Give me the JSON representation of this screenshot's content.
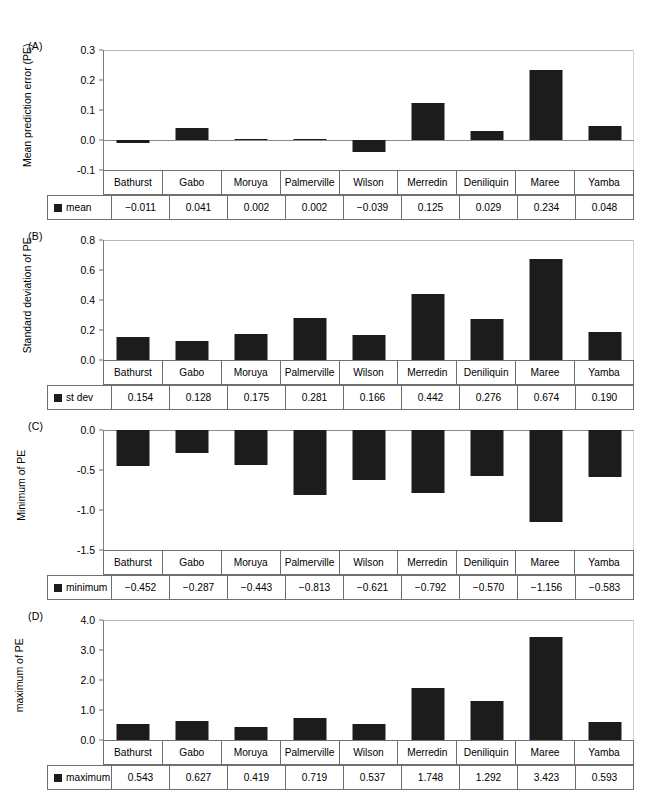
{
  "categories": [
    "Bathurst",
    "Gabo",
    "Moruya",
    "Palmerville",
    "Wilson",
    "Merredin",
    "Deniliquin",
    "Maree",
    "Yamba"
  ],
  "colors": {
    "bar": "#1c1c1c",
    "axis": "#7c7c7c",
    "grid": "#b6b6b6",
    "table_border": "#6f6f6f"
  },
  "panels": [
    {
      "key": "A",
      "letter": "(A)",
      "axis_title": "Mean prediction error (PE)",
      "legend_label": "mean",
      "ticks": [
        "0.3",
        "0.2",
        "0.1",
        "0.0",
        "-0.1"
      ],
      "values_text": [
        "−0.011",
        "0.041",
        "0.002",
        "0.002",
        "−0.039",
        "0.125",
        "0.029",
        "0.234",
        "0.048"
      ]
    },
    {
      "key": "B",
      "letter": "(B)",
      "axis_title": "Standard deviation of PE",
      "legend_label": "st dev",
      "ticks": [
        "0.8",
        "0.6",
        "0.4",
        "0.2",
        "0.0"
      ],
      "values_text": [
        "0.154",
        "0.128",
        "0.175",
        "0.281",
        "0.166",
        "0.442",
        "0.276",
        "0.674",
        "0.190"
      ]
    },
    {
      "key": "C",
      "letter": "(C)",
      "axis_title": "Minimum of PE",
      "legend_label": "minimum",
      "ticks": [
        "0.0",
        "-0.5",
        "-1.0",
        "-1.5"
      ],
      "values_text": [
        "−0.452",
        "−0.287",
        "−0.443",
        "−0.813",
        "−0.621",
        "−0.792",
        "−0.570",
        "−1.156",
        "−0.583"
      ]
    },
    {
      "key": "D",
      "letter": "(D)",
      "axis_title": "maximum of PE",
      "legend_label": "maximum",
      "ticks": [
        "4.0",
        "3.0",
        "2.0",
        "1.0",
        "0.0"
      ],
      "values_text": [
        "0.543",
        "0.627",
        "0.419",
        "0.719",
        "0.537",
        "1.748",
        "1.292",
        "3.423",
        "0.593"
      ]
    }
  ],
  "chart_data": [
    {
      "type": "bar",
      "panel": "A",
      "title": "(A)",
      "xlabel": "",
      "ylabel": "Mean prediction error (PE)",
      "categories": [
        "Bathurst",
        "Gabo",
        "Moruya",
        "Palmerville",
        "Wilson",
        "Merredin",
        "Deniliquin",
        "Maree",
        "Yamba"
      ],
      "series": [
        {
          "name": "mean",
          "values": [
            -0.011,
            0.041,
            0.002,
            0.002,
            -0.039,
            0.125,
            0.029,
            0.234,
            0.048
          ]
        }
      ],
      "values": [
        -0.011,
        0.041,
        0.002,
        0.002,
        -0.039,
        0.125,
        0.029,
        0.234,
        0.048
      ],
      "ylim": [
        -0.1,
        0.3
      ],
      "yticks": [
        -0.1,
        0.0,
        0.1,
        0.2,
        0.3
      ],
      "grid": false,
      "legend": "bottom-table"
    },
    {
      "type": "bar",
      "panel": "B",
      "title": "(B)",
      "xlabel": "",
      "ylabel": "Standard deviation of PE",
      "categories": [
        "Bathurst",
        "Gabo",
        "Moruya",
        "Palmerville",
        "Wilson",
        "Merredin",
        "Deniliquin",
        "Maree",
        "Yamba"
      ],
      "series": [
        {
          "name": "st dev",
          "values": [
            0.154,
            0.128,
            0.175,
            0.281,
            0.166,
            0.442,
            0.276,
            0.674,
            0.19
          ]
        }
      ],
      "values": [
        0.154,
        0.128,
        0.175,
        0.281,
        0.166,
        0.442,
        0.276,
        0.674,
        0.19
      ],
      "ylim": [
        0.0,
        0.8
      ],
      "yticks": [
        0.0,
        0.2,
        0.4,
        0.6,
        0.8
      ],
      "grid": false,
      "legend": "bottom-table"
    },
    {
      "type": "bar",
      "panel": "C",
      "title": "(C)",
      "xlabel": "",
      "ylabel": "Minimum of PE",
      "categories": [
        "Bathurst",
        "Gabo",
        "Moruya",
        "Palmerville",
        "Wilson",
        "Merredin",
        "Deniliquin",
        "Maree",
        "Yamba"
      ],
      "series": [
        {
          "name": "minimum",
          "values": [
            -0.452,
            -0.287,
            -0.443,
            -0.813,
            -0.621,
            -0.792,
            -0.57,
            -1.156,
            -0.583
          ]
        }
      ],
      "values": [
        -0.452,
        -0.287,
        -0.443,
        -0.813,
        -0.621,
        -0.792,
        -0.57,
        -1.156,
        -0.583
      ],
      "ylim": [
        -1.5,
        0.0
      ],
      "yticks": [
        -1.5,
        -1.0,
        -0.5,
        0.0
      ],
      "grid": false,
      "legend": "bottom-table"
    },
    {
      "type": "bar",
      "panel": "D",
      "title": "(D)",
      "xlabel": "",
      "ylabel": "maximum of PE",
      "categories": [
        "Bathurst",
        "Gabo",
        "Moruya",
        "Palmerville",
        "Wilson",
        "Merredin",
        "Deniliquin",
        "Maree",
        "Yamba"
      ],
      "series": [
        {
          "name": "maximum",
          "values": [
            0.543,
            0.627,
            0.419,
            0.719,
            0.537,
            1.748,
            1.292,
            3.423,
            0.593
          ]
        }
      ],
      "values": [
        0.543,
        0.627,
        0.419,
        0.719,
        0.537,
        1.748,
        1.292,
        3.423,
        0.593
      ],
      "ylim": [
        0.0,
        4.0
      ],
      "yticks": [
        0.0,
        1.0,
        2.0,
        3.0,
        4.0
      ],
      "grid": false,
      "legend": "bottom-table"
    }
  ]
}
